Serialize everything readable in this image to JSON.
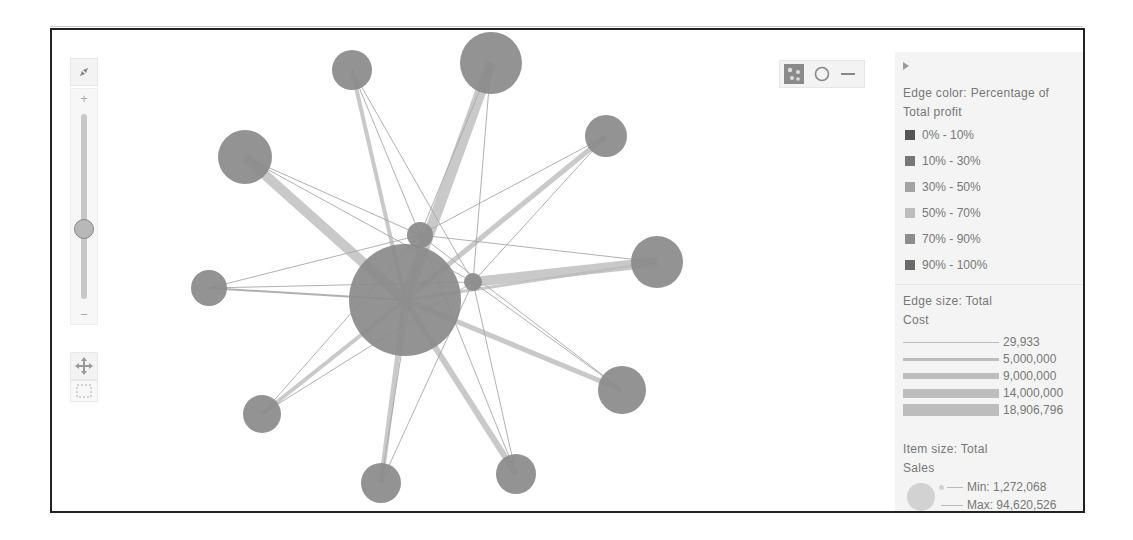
{
  "navigation": {
    "fit_icon": "fit-to-screen-icon",
    "zoom_in_label": "+",
    "zoom_out_label": "−",
    "zoom_level_percent": 55,
    "pan_icon": "pan-icon",
    "marquee_icon": "marquee-select-icon"
  },
  "mode_toggles": [
    {
      "name": "layout-toggle",
      "icon": "layout-icon",
      "active": true
    },
    {
      "name": "node-toggle",
      "icon": "circle-icon",
      "active": false
    },
    {
      "name": "edge-toggle",
      "icon": "line-icon",
      "active": false
    }
  ],
  "legend": {
    "collapse_icon": "triangle-right-icon",
    "edge_color": {
      "title_line1": "Edge color: Percentage of",
      "title_line2": "Total profit",
      "items": [
        {
          "label": "0% - 10%",
          "color": "#555555"
        },
        {
          "label": "10% - 30%",
          "color": "#777777"
        },
        {
          "label": "30% - 50%",
          "color": "#a3a3a3"
        },
        {
          "label": "50% - 70%",
          "color": "#bdbdbd"
        },
        {
          "label": "70% - 90%",
          "color": "#8c8c8c"
        },
        {
          "label": "90% - 100%",
          "color": "#6a6a6a"
        }
      ]
    },
    "edge_size": {
      "title_line1": "Edge size: Total",
      "title_line2": "Cost",
      "items": [
        {
          "label": "29,933",
          "thickness": 1
        },
        {
          "label": "5,000,000",
          "thickness": 3
        },
        {
          "label": "9,000,000",
          "thickness": 6
        },
        {
          "label": "14,000,000",
          "thickness": 9
        },
        {
          "label": "18,906,796",
          "thickness": 12
        }
      ]
    },
    "item_size": {
      "title_line1": "Item size: Total",
      "title_line2": "Sales",
      "min_label": "Min: 1,272,068",
      "max_label": "Max: 94,620,526"
    }
  },
  "graph": {
    "node_color": "#8a8a8a",
    "edge_color": "#bcbcbc",
    "nodes": [
      {
        "id": "center",
        "x": 405,
        "y": 300,
        "r": 56
      },
      {
        "id": "n1",
        "x": 352,
        "y": 70,
        "r": 20
      },
      {
        "id": "n2",
        "x": 491,
        "y": 63,
        "r": 31
      },
      {
        "id": "n3",
        "x": 245,
        "y": 157,
        "r": 27
      },
      {
        "id": "n4",
        "x": 606,
        "y": 136,
        "r": 21
      },
      {
        "id": "n5",
        "x": 657,
        "y": 262,
        "r": 26
      },
      {
        "id": "n6",
        "x": 209,
        "y": 288,
        "r": 18
      },
      {
        "id": "n7",
        "x": 262,
        "y": 414,
        "r": 19
      },
      {
        "id": "n8",
        "x": 381,
        "y": 483,
        "r": 20
      },
      {
        "id": "n9",
        "x": 516,
        "y": 474,
        "r": 20
      },
      {
        "id": "n10",
        "x": 622,
        "y": 390,
        "r": 24
      },
      {
        "id": "hubA",
        "x": 420,
        "y": 235,
        "r": 13
      },
      {
        "id": "hubB",
        "x": 473,
        "y": 282,
        "r": 9
      }
    ],
    "edges": [
      {
        "from": "center",
        "to": "n1",
        "w": 4
      },
      {
        "from": "center",
        "to": "n2",
        "w": 11
      },
      {
        "from": "center",
        "to": "n3",
        "w": 10
      },
      {
        "from": "center",
        "to": "n4",
        "w": 5
      },
      {
        "from": "center",
        "to": "n5",
        "w": 3
      },
      {
        "from": "center",
        "to": "n6",
        "w": 2
      },
      {
        "from": "center",
        "to": "n7",
        "w": 4
      },
      {
        "from": "center",
        "to": "n8",
        "w": 5
      },
      {
        "from": "center",
        "to": "n9",
        "w": 6
      },
      {
        "from": "center",
        "to": "n10",
        "w": 5
      },
      {
        "from": "hubA",
        "to": "n1",
        "w": 1
      },
      {
        "from": "hubA",
        "to": "n2",
        "w": 1
      },
      {
        "from": "hubA",
        "to": "n3",
        "w": 1
      },
      {
        "from": "hubA",
        "to": "n4",
        "w": 1
      },
      {
        "from": "hubA",
        "to": "n5",
        "w": 1
      },
      {
        "from": "hubA",
        "to": "n6",
        "w": 1
      },
      {
        "from": "hubA",
        "to": "n7",
        "w": 1
      },
      {
        "from": "hubA",
        "to": "n8",
        "w": 1
      },
      {
        "from": "hubA",
        "to": "n9",
        "w": 1
      },
      {
        "from": "hubA",
        "to": "n10",
        "w": 1
      },
      {
        "from": "hubB",
        "to": "n1",
        "w": 1
      },
      {
        "from": "hubB",
        "to": "n2",
        "w": 1
      },
      {
        "from": "hubB",
        "to": "n3",
        "w": 1
      },
      {
        "from": "hubB",
        "to": "n4",
        "w": 1
      },
      {
        "from": "hubB",
        "to": "n5",
        "w": 10
      },
      {
        "from": "hubB",
        "to": "n6",
        "w": 1
      },
      {
        "from": "hubB",
        "to": "n7",
        "w": 1
      },
      {
        "from": "hubB",
        "to": "n8",
        "w": 1
      },
      {
        "from": "hubB",
        "to": "n9",
        "w": 1
      },
      {
        "from": "hubB",
        "to": "n10",
        "w": 1
      }
    ]
  }
}
